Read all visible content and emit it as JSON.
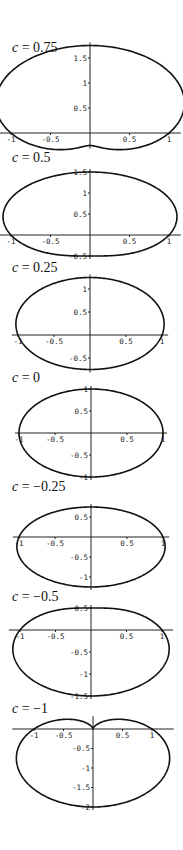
{
  "figure": {
    "equation_form": "r = 1 + c sin(theta)",
    "panels": [
      {
        "label_var": "c",
        "label_value": "= 0.75"
      },
      {
        "label_var": "c",
        "label_value": "= 0.5"
      },
      {
        "label_var": "c",
        "label_value": "= 0.25"
      },
      {
        "label_var": "c",
        "label_value": "= 0"
      },
      {
        "label_var": "c",
        "label_value": "= −0.25"
      },
      {
        "label_var": "c",
        "label_value": "= −0.5"
      },
      {
        "label_var": "c",
        "label_value": "= −1"
      }
    ]
  },
  "chart_data": [
    {
      "type": "line",
      "title": "c = 0.75",
      "c": 0.75,
      "xlim": [
        -1.1,
        1.1
      ],
      "ylim": [
        -0.25,
        1.75
      ],
      "xticks": [
        -1,
        -0.5,
        0.5,
        1
      ],
      "yticks": [
        0.5,
        1,
        1.5
      ],
      "grid": false,
      "legend": "none"
    },
    {
      "type": "line",
      "title": "c = 0.5",
      "c": 0.5,
      "xlim": [
        -1.1,
        1.1
      ],
      "ylim": [
        -0.5,
        1.5
      ],
      "xticks": [
        -1,
        -0.5,
        0.5,
        1
      ],
      "yticks": [
        -0.5,
        0.5,
        1,
        1.5
      ],
      "grid": false,
      "legend": "none"
    },
    {
      "type": "line",
      "title": "c = 0.25",
      "c": 0.25,
      "xlim": [
        -1.03,
        1.03
      ],
      "ylim": [
        -0.75,
        1.25
      ],
      "xticks": [
        -1,
        -0.5,
        0.5,
        1
      ],
      "yticks": [
        -0.5,
        0.5,
        1
      ],
      "grid": false,
      "legend": "none"
    },
    {
      "type": "line",
      "title": "c = 0",
      "c": 0,
      "xlim": [
        -1,
        1
      ],
      "ylim": [
        -1,
        1
      ],
      "xticks": [
        -1,
        -0.5,
        0.5,
        1
      ],
      "yticks": [
        -1,
        -0.5,
        0.5,
        1
      ],
      "grid": false,
      "legend": "none"
    },
    {
      "type": "line",
      "title": "c = −0.25",
      "c": -0.25,
      "xlim": [
        -1.03,
        1.03
      ],
      "ylim": [
        -1.25,
        0.75
      ],
      "xticks": [
        -1,
        -0.5,
        0.5,
        1
      ],
      "yticks": [
        -1,
        -0.5,
        0.5
      ],
      "grid": false,
      "legend": "none"
    },
    {
      "type": "line",
      "title": "c = −0.5",
      "c": -0.5,
      "xlim": [
        -1.1,
        1.1
      ],
      "ylim": [
        -1.5,
        0.5
      ],
      "xticks": [
        -1,
        -0.5,
        0.5,
        1
      ],
      "yticks": [
        -1.5,
        -1,
        -0.5,
        0.5
      ],
      "grid": false,
      "legend": "none"
    },
    {
      "type": "line",
      "title": "c = −1",
      "c": -1,
      "xlim": [
        -1.3,
        1.3
      ],
      "ylim": [
        -2,
        0.25
      ],
      "xticks": [
        -1,
        -0.5,
        0.5,
        1
      ],
      "yticks": [
        -2,
        -1.5,
        -1,
        -0.5
      ],
      "grid": false,
      "legend": "none"
    }
  ]
}
